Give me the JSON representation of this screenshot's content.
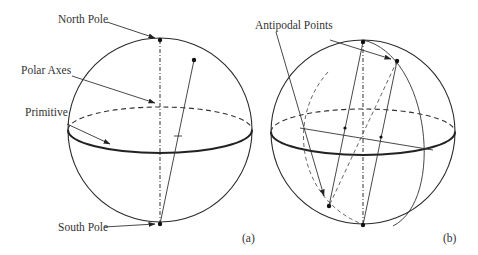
{
  "figure": {
    "panels": [
      {
        "id": "a",
        "caption": "(a)",
        "labels": {
          "north_pole": "North Pole",
          "polar_axes": "Polar Axes",
          "primitive": "Primitive",
          "south_pole": "South Pole"
        }
      },
      {
        "id": "b",
        "caption": "(b)",
        "labels": {
          "antipodal_points": "Antipodal Points"
        }
      }
    ]
  }
}
